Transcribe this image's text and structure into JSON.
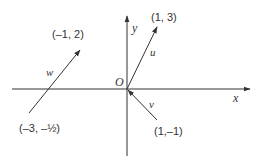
{
  "diagram": {
    "axes": {
      "x_label": "x",
      "y_label": "y",
      "origin_label": "O"
    },
    "vectors": [
      {
        "name": "u",
        "label": "u⃗",
        "tail_label": "",
        "head_label": "(1, 3)"
      },
      {
        "name": "v",
        "label": "v⃗",
        "tail_label": "(1,–1)",
        "head_label": ""
      },
      {
        "name": "w",
        "label": "w⃗",
        "tail_label": "(–3, –½)",
        "head_label": "(–1, 2)"
      }
    ],
    "colors": {
      "line": "#333333",
      "background": "#ffffff"
    }
  }
}
